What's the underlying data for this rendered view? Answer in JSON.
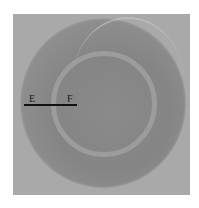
{
  "image": {
    "description": "Grayscale photograph of a circular disc / petri dish with an inner lighter ring",
    "background_color": "#a9a9a9",
    "disc_color": "#878787",
    "ring_color": "#9c9c9c"
  },
  "annotations": {
    "label_left": "E",
    "label_right": "F",
    "line_color": "#111111"
  }
}
